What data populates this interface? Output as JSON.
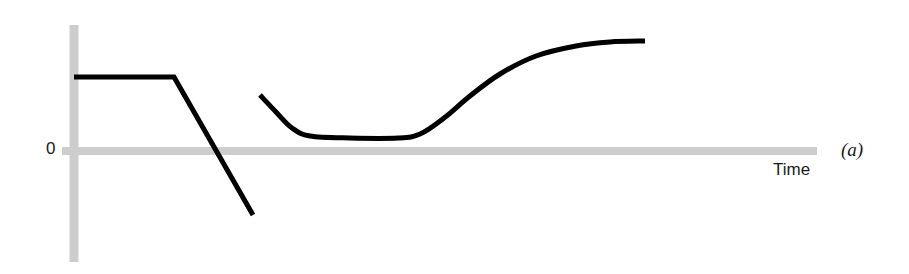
{
  "figure": {
    "panel_label": "(a)",
    "origin_label": "0",
    "x_axis_label": "Time",
    "background_color": "#ffffff",
    "axis_color": "#cdcdcd",
    "curve_color": "#000000"
  },
  "chart_data": {
    "type": "line",
    "title": "",
    "subtitle": "",
    "xlabel": "Time",
    "ylabel": "",
    "panel": "(a)",
    "grid": false,
    "legend": null,
    "axis_style": {
      "y_axis_color": "#cdcdcd",
      "y_axis_thickness_px": 9,
      "x_axis_color": "#cdcdcd",
      "x_axis_thickness_px": 8,
      "y_axis_x_px": 74,
      "y_axis_top_px": 25,
      "y_axis_bottom_px": 262,
      "x_axis_y_px": 151,
      "x_axis_left_px": 62,
      "x_axis_right_px": 817
    },
    "axis_ticks": {
      "y_ticks": [
        0
      ],
      "y_tick_labels": [
        "0"
      ],
      "x_ticks": [],
      "x_tick_labels": []
    },
    "xlim": [
      0,
      909
    ],
    "ylim": [
      -1,
      1
    ],
    "zero_line_y_px": 151,
    "series": [
      {
        "name": "step-then-decline",
        "color": "#000000",
        "width_px": 5,
        "shape": "polyline",
        "description": "Flat positive plateau from the vertical axis, then a steep straight decline crossing zero into negative territory.",
        "points_px": [
          [
            74,
            77
          ],
          [
            174,
            77
          ],
          [
            253,
            215
          ]
        ],
        "values": [
          {
            "x": 0.0,
            "y": 0.6
          },
          {
            "x": 0.12,
            "y": 0.6
          },
          {
            "x": 0.21,
            "y": -0.57
          }
        ]
      },
      {
        "name": "dip-then-recovery",
        "color": "#000000",
        "width_px": 5,
        "shape": "smooth-curve",
        "description": "Begins mid-positive, dips down to a flat trough just above zero, then rises smoothly in an S-curve to a high plateau.",
        "points_px": [
          [
            260,
            95
          ],
          [
            276,
            112
          ],
          [
            292,
            128
          ],
          [
            310,
            136
          ],
          [
            350,
            138
          ],
          [
            398,
            138
          ],
          [
            420,
            134
          ],
          [
            444,
            118
          ],
          [
            470,
            96
          ],
          [
            500,
            74
          ],
          [
            536,
            56
          ],
          [
            576,
            46
          ],
          [
            610,
            42
          ],
          [
            645,
            41
          ]
        ],
        "values": [
          {
            "x": 0.22,
            "y": 0.47
          },
          {
            "x": 0.24,
            "y": 0.33
          },
          {
            "x": 0.26,
            "y": 0.19
          },
          {
            "x": 0.28,
            "y": 0.13
          },
          {
            "x": 0.33,
            "y": 0.11
          },
          {
            "x": 0.38,
            "y": 0.11
          },
          {
            "x": 0.41,
            "y": 0.14
          },
          {
            "x": 0.44,
            "y": 0.28
          },
          {
            "x": 0.47,
            "y": 0.47
          },
          {
            "x": 0.51,
            "y": 0.65
          },
          {
            "x": 0.55,
            "y": 0.81
          },
          {
            "x": 0.6,
            "y": 0.89
          },
          {
            "x": 0.64,
            "y": 0.92
          },
          {
            "x": 0.68,
            "y": 0.93
          }
        ]
      }
    ]
  }
}
